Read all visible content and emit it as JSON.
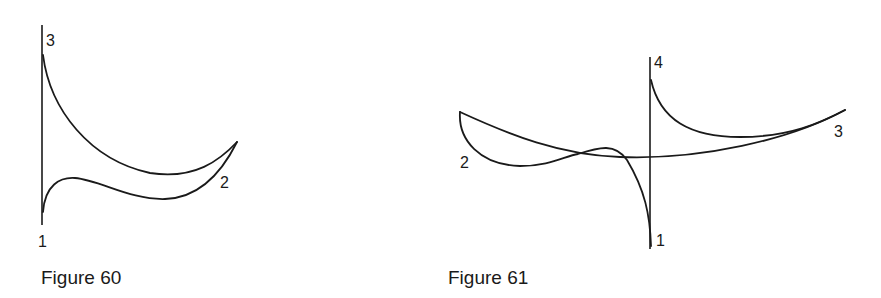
{
  "figures": [
    {
      "caption": "Figure 60",
      "point_labels": {
        "p1": "1",
        "p2": "2",
        "p3": "3"
      }
    },
    {
      "caption": "Figure 61",
      "point_labels": {
        "p1": "1",
        "p2": "2",
        "p3": "3",
        "p4": "4"
      }
    }
  ],
  "style": {
    "stroke_color": "#1a1a1a",
    "background": "#ffffff"
  }
}
